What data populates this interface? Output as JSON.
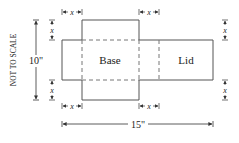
{
  "diagram": {
    "side_label": "NOT TO SCALE",
    "height_label": "10\"",
    "width_label": "15\"",
    "base_label": "Base",
    "lid_label": "Lid",
    "cut_label": "x",
    "colors": {
      "solid": "#555555",
      "dashed": "#777777",
      "text": "#222222"
    },
    "dimensions": {
      "height_in": 10,
      "width_in": 15,
      "cut_variable": "x"
    }
  }
}
